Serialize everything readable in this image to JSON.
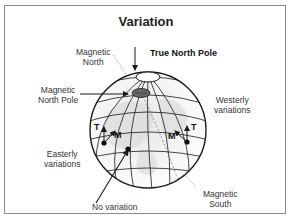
{
  "title": "Variation",
  "labels": {
    "magnetic_north": [
      "Magnetic",
      "North"
    ],
    "true_north_pole": "True North Pole",
    "magnetic_north_pole": [
      "Magnetic",
      "North Pole"
    ],
    "westerly_variations": [
      "Westerly",
      "variations"
    ],
    "easterly_variations": [
      "Easterly",
      "variations"
    ],
    "no_variation": "No variation",
    "magnetic_south": [
      "Magnetic",
      "South"
    ],
    "true_marker": "T",
    "magnetic_marker": "M"
  },
  "colors": {
    "line": "#1a1a1a",
    "frame": "#8a8a8a",
    "pole_fill": "#666666",
    "land_shade": "#d8d8d8"
  }
}
